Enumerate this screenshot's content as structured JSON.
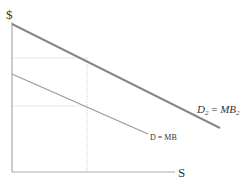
{
  "diagram": {
    "y_axis_label": "$",
    "x_axis_label": "S",
    "curves": [
      {
        "id": "d2",
        "label_main": "D",
        "label_sub": "2",
        "label_eq": " = ",
        "label_main2": "MB",
        "label_sub2": "2",
        "x1": 12,
        "y1": 24,
        "x2": 220,
        "y2": 128,
        "color": "#888888",
        "width": 2
      },
      {
        "id": "d",
        "label": "D = MB",
        "x1": 12,
        "y1": 74,
        "x2": 148,
        "y2": 134,
        "color": "#999999",
        "width": 1.2
      }
    ],
    "guides": {
      "vertical_x": 87,
      "upper_y": 58,
      "lower_y": 106,
      "color": "#c8c8c8"
    },
    "axes": {
      "origin_x": 12,
      "origin_y": 172,
      "top_y": 22,
      "right_x": 175,
      "color": "#aaaaaa"
    }
  }
}
